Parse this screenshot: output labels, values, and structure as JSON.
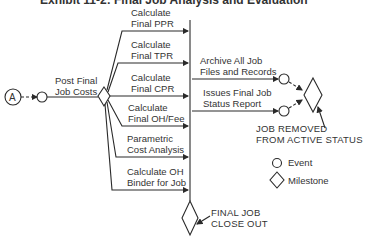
{
  "title": "Exhibit 11-2: Final Job Analysis and Evaluation",
  "start_node": {
    "label": "A"
  },
  "start_task": {
    "line1": "Post Final",
    "line2": "Job Costs"
  },
  "tasks": [
    {
      "line1": "Calculate",
      "line2": "Final PPR"
    },
    {
      "line1": "Calculate",
      "line2": "Final TPR"
    },
    {
      "line1": "Calculate",
      "line2": "Final CPR"
    },
    {
      "line1": "Calculate",
      "line2": "Final OH/Fee"
    },
    {
      "line1": "Parametric",
      "line2": "Cost Analysis"
    },
    {
      "line1": "Calculate OH",
      "line2": "Binder for Job"
    }
  ],
  "post_tasks": [
    {
      "line1": "Archive All Job",
      "line2": "Files and Records"
    },
    {
      "line1": "Issues Final Job",
      "line2": "Status Report"
    }
  ],
  "milestones": {
    "job_removed": {
      "line1": "JOB REMOVED",
      "line2": "FROM ACTIVE STATUS"
    },
    "final_close": {
      "line1": "FINAL JOB",
      "line2": "CLOSE OUT"
    }
  },
  "legend": {
    "event": "Event",
    "milestone": "Milestone"
  },
  "colors": {
    "stroke": "#2a2a2a",
    "background": "#ffffff"
  }
}
